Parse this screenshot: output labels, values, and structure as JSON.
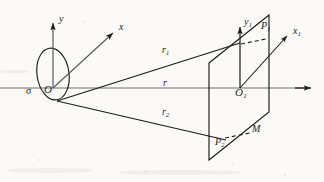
{
  "figure": {
    "type": "optics-diffraction-geometry-diagram",
    "background_color": "#fbfaf8",
    "ink_color": "#1a1a1a",
    "width": 324,
    "height": 182
  },
  "labels": {
    "y_axis": "y",
    "x_axis": "x",
    "origin": "O",
    "aperture": "σ",
    "ray_upper": "r",
    "ray_upper_sub": "1",
    "ray_center": "r",
    "ray_lower": "r",
    "ray_lower_sub": "2",
    "y1_axis": "y",
    "y1_axis_sub": "1",
    "x1_axis": "x",
    "x1_axis_sub": "1",
    "origin1": "O",
    "origin1_sub": "1",
    "point_p1": "P",
    "point_p1_sub": "1",
    "point_p2": "P",
    "point_p2_sub": "2",
    "plane": "M"
  },
  "geometry": {
    "optical_axis": {
      "x1": 0,
      "y1": 88,
      "x2": 312,
      "y2": 88
    },
    "aperture_ellipse": {
      "cx": 53,
      "cy": 74,
      "rx": 16,
      "ry": 26,
      "rotation": -8
    },
    "origin_point": {
      "x": 53,
      "y": 88
    },
    "y_axis_line": {
      "x1": 53,
      "y1": 88,
      "x2": 53,
      "y2": 18
    },
    "x_axis_line": {
      "x1": 53,
      "y1": 88,
      "x2": 117,
      "y2": 30
    },
    "source_point": {
      "x": 57,
      "y": 101
    },
    "ray_r1": {
      "x1": 57,
      "y1": 101,
      "x2": 240,
      "y2": 43
    },
    "ray_r2": {
      "x1": 57,
      "y1": 101,
      "x2": 224,
      "y2": 140
    },
    "observation_plane_M": {
      "corners": [
        {
          "x": 209,
          "y": 63
        },
        {
          "x": 269,
          "y": 15
        },
        {
          "x": 269,
          "y": 112
        },
        {
          "x": 209,
          "y": 160
        }
      ]
    },
    "y1_axis_line": {
      "x1": 240,
      "y1": 88,
      "x2": 240,
      "y2": 22
    },
    "x1_axis_line": {
      "x1": 240,
      "y1": 88,
      "x2": 290,
      "y2": 32
    },
    "origin1_point": {
      "x": 240,
      "y": 88
    },
    "p1_point": {
      "x": 268,
      "y": 38
    },
    "p1_dashed_connector": {
      "x1": 241,
      "y1": 44,
      "x2": 266,
      "y2": 39
    },
    "p2_point": {
      "x": 224,
      "y": 139
    },
    "p2_dashed_connector": {
      "x1": 225,
      "y1": 139,
      "x2": 249,
      "y2": 134
    }
  },
  "label_positions": {
    "y_axis": {
      "x": 59,
      "y": 19
    },
    "x_axis": {
      "x": 120,
      "y": 28
    },
    "origin": {
      "x": 44,
      "y": 90
    },
    "aperture": {
      "x": 27,
      "y": 92
    },
    "ray_upper": {
      "x": 163,
      "y": 50
    },
    "ray_center": {
      "x": 163,
      "y": 82
    },
    "ray_lower": {
      "x": 163,
      "y": 112
    },
    "y1_axis": {
      "x": 245,
      "y": 22
    },
    "x1_axis": {
      "x": 294,
      "y": 32
    },
    "origin1": {
      "x": 237,
      "y": 92
    },
    "point_p1": {
      "x": 262,
      "y": 26
    },
    "point_p2": {
      "x": 216,
      "y": 142
    },
    "plane": {
      "x": 253,
      "y": 128
    }
  }
}
